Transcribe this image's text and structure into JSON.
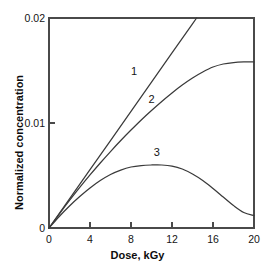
{
  "chart_data": {
    "type": "line",
    "title": "",
    "xlabel": "Dose, kGy",
    "ylabel": "Normalized concentration",
    "xlim": [
      0,
      20
    ],
    "ylim": [
      0,
      0.02
    ],
    "xticks": [
      "0",
      "4",
      "8",
      "12",
      "16",
      "20"
    ],
    "xtick_values": [
      0,
      4,
      8,
      12,
      16,
      20
    ],
    "yticks": [
      "0",
      "0.01",
      "0.02"
    ],
    "ytick_values": [
      0,
      0.01,
      0.02
    ],
    "grid": false,
    "legend": "inline-curve-labels",
    "series": [
      {
        "name": "1",
        "label": "1",
        "style": "straight-line-clipped-at-top",
        "x": [
          0,
          2,
          4,
          6,
          8,
          10,
          12,
          14,
          14.4
        ],
        "values": [
          0,
          0.00278,
          0.00556,
          0.00833,
          0.01111,
          0.01389,
          0.01667,
          0.01944,
          0.02
        ]
      },
      {
        "name": "2",
        "label": "2",
        "style": "saturating-curve",
        "x": [
          0,
          1,
          2,
          3,
          4,
          5,
          6,
          7,
          8,
          9,
          10,
          11,
          12,
          13,
          14,
          15,
          16,
          17,
          18,
          19,
          20
        ],
        "values": [
          0,
          0.00133,
          0.00262,
          0.00386,
          0.00505,
          0.00619,
          0.00728,
          0.00833,
          0.00933,
          0.01029,
          0.01119,
          0.01205,
          0.01286,
          0.01362,
          0.01429,
          0.01486,
          0.01533,
          0.01562,
          0.01576,
          0.01581,
          0.01581
        ]
      },
      {
        "name": "3",
        "label": "3",
        "style": "rise-and-fall-curve",
        "x": [
          0,
          1,
          2,
          3,
          4,
          5,
          6,
          7,
          8,
          9,
          10,
          11,
          12,
          13,
          14,
          15,
          16,
          17,
          18,
          19,
          20
        ],
        "values": [
          0,
          0.0011,
          0.0021,
          0.003,
          0.00381,
          0.00452,
          0.0051,
          0.00552,
          0.00581,
          0.00595,
          0.006,
          0.006,
          0.0059,
          0.00562,
          0.00514,
          0.00452,
          0.00376,
          0.00295,
          0.00214,
          0.00148,
          0.00119
        ]
      }
    ],
    "annotations": [
      {
        "text": "1",
        "x": 8.4,
        "y": 0.0149
      },
      {
        "text": "2",
        "x": 10.1,
        "y": 0.0122
      },
      {
        "text": "3",
        "x": 10.6,
        "y": 0.0071
      }
    ]
  },
  "axes": {
    "xlabel": "Dose, kGy",
    "ylabel": "Normalized concentration",
    "ytick_top": "0.02",
    "ytick_mid": "0.01",
    "ytick_bottom": "0",
    "xtick_0": "0",
    "xtick_4": "4",
    "xtick_8": "8",
    "xtick_12": "12",
    "xtick_16": "16",
    "xtick_20": "20"
  },
  "colors": {
    "curve": "#3a3a3a",
    "axis": "#4a4a4a",
    "text": "#141414",
    "background": "#ffffff"
  }
}
